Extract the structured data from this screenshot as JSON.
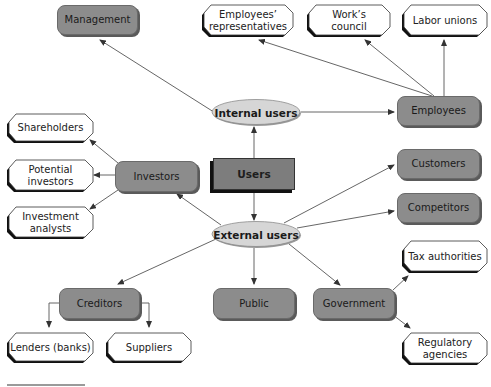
{
  "diagram": {
    "root": "Users",
    "branches": {
      "internal": {
        "label": "Internal users",
        "children": [
          "Management",
          "Employees"
        ],
        "employees_children": [
          "Employees' representatives",
          "Work's council",
          "Labor unions"
        ]
      },
      "external": {
        "label": "External users",
        "children": [
          "Investors",
          "Customers",
          "Competitors",
          "Creditors",
          "Public",
          "Government"
        ],
        "investors_children": [
          "Shareholders",
          "Potential investors",
          "Investment analysts"
        ],
        "creditors_children": [
          "Lenders (banks)",
          "Suppliers"
        ],
        "government_children": [
          "Tax authorities",
          "Regulatory agencies"
        ]
      }
    }
  },
  "nodes": {
    "users": "Users",
    "internal_users": "Internal users",
    "external_users": "External users",
    "management": "Management",
    "employees": "Employees",
    "employees_representatives_l1": "Employees’",
    "employees_representatives_l2": "representatives",
    "works_council_l1": "Work’s",
    "works_council_l2": "council",
    "labor_unions": "Labor unions",
    "investors": "Investors",
    "shareholders": "Shareholders",
    "potential_investors_l1": "Potential",
    "potential_investors_l2": "investors",
    "investment_analysts_l1": "Investment",
    "investment_analysts_l2": "analysts",
    "customers": "Customers",
    "competitors": "Competitors",
    "creditors": "Creditors",
    "lenders": "Lenders (banks)",
    "suppliers": "Suppliers",
    "public": "Public",
    "government": "Government",
    "tax_authorities": "Tax authorities",
    "regulatory_agencies_l1": "Regulatory",
    "regulatory_agencies_l2": "agencies"
  },
  "colors": {
    "gray_box": "#8c8c8c",
    "dark_box": "#7d7d7d",
    "ellipse_fill": "#d4d4d4",
    "arrow": "#444444",
    "octagon_shadow": "#111111"
  }
}
